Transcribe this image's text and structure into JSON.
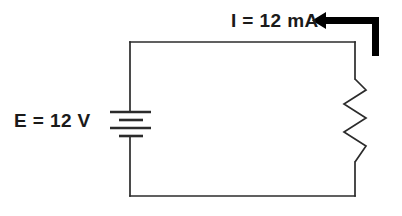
{
  "diagram": {
    "type": "schematic",
    "title": "",
    "stroke_color": "#2b2b2b",
    "arrow_color": "#000000",
    "background_color": "#ffffff",
    "labels": {
      "source": "E = 12 V",
      "current": "I = 12 mA"
    },
    "components": [
      {
        "name": "battery",
        "symbol": "multi-cell-battery",
        "label": "E = 12 V",
        "value": "12",
        "unit": "V",
        "quantity": "voltage",
        "plate_count": 4,
        "position": "left-branch"
      },
      {
        "name": "resistor",
        "symbol": "zigzag-resistor",
        "label": "",
        "value": "",
        "unit": "",
        "quantity": "resistance",
        "position": "right-branch"
      }
    ],
    "annotations": [
      {
        "name": "current-arrow",
        "label": "I = 12 mA",
        "value": "12",
        "unit": "mA",
        "quantity": "current",
        "direction": "left",
        "location": "top-wire"
      }
    ],
    "geometry": {
      "loop_left": 130,
      "loop_right": 355,
      "loop_top": 42,
      "loop_bottom": 196,
      "wire_width": 1.6
    }
  }
}
